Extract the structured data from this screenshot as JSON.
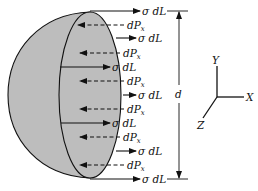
{
  "diagram": {
    "colors": {
      "shell_fill": "#bdbdbd",
      "stroke": "#111111",
      "background": "#ffffff"
    },
    "labels": {
      "stress_force": "σ dL",
      "pressure_force_main": "dP",
      "pressure_force_sub": "x",
      "dimension": "d",
      "axis_x": "X",
      "axis_y": "Y",
      "axis_z": "Z"
    },
    "rows": [
      {
        "type": "stress",
        "y": 11,
        "x1": 90,
        "x2": 140
      },
      {
        "type": "pressure",
        "y": 25,
        "x1": 124,
        "x2": 78
      },
      {
        "type": "stress",
        "y": 38,
        "x1": 116,
        "x2": 136
      },
      {
        "type": "pressure",
        "y": 53,
        "x1": 120,
        "x2": 80
      },
      {
        "type": "stress",
        "y": 67,
        "x1": 60,
        "x2": 110
      },
      {
        "type": "pressure",
        "y": 81,
        "x1": 124,
        "x2": 80
      },
      {
        "type": "stress",
        "y": 95,
        "x1": 123,
        "x2": 136
      },
      {
        "type": "pressure",
        "y": 109,
        "x1": 124,
        "x2": 80
      },
      {
        "type": "stress",
        "y": 123,
        "x1": 61,
        "x2": 110
      },
      {
        "type": "pressure",
        "y": 137,
        "x1": 120,
        "x2": 80
      },
      {
        "type": "stress",
        "y": 151,
        "x1": 116,
        "x2": 136
      },
      {
        "type": "pressure",
        "y": 165,
        "x1": 124,
        "x2": 80
      },
      {
        "type": "stress",
        "y": 179,
        "x1": 90,
        "x2": 140
      }
    ]
  }
}
